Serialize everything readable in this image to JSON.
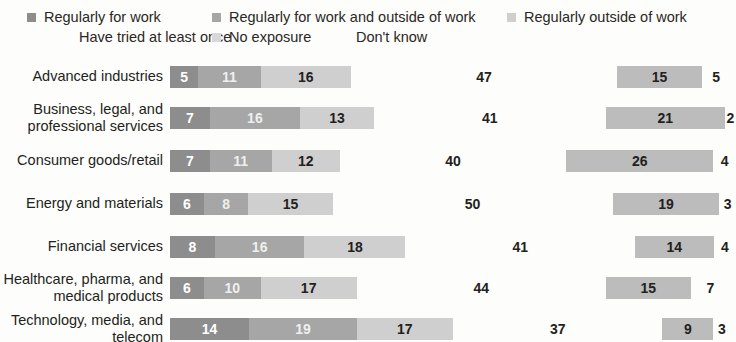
{
  "legend": {
    "items": [
      {
        "label": "Regularly for work",
        "color": "#8d8d8d",
        "has_swatch": true
      },
      {
        "label": "Have tried at least once",
        "color": "#bcbcbc",
        "has_swatch": false
      },
      {
        "label": "Regularly for work and outside of work",
        "color": "#a6a6a6",
        "has_swatch": true
      },
      {
        "label": "No exposure",
        "color": "#d8d8d8",
        "has_swatch": true
      },
      {
        "label": "Don't know",
        "color": "#fdfdfb",
        "has_swatch": false
      },
      {
        "label": "Regularly outside of work",
        "color": "#cfcfcf",
        "has_swatch": true
      }
    ]
  },
  "chart_data": {
    "type": "bar",
    "orientation": "horizontal",
    "stacked": true,
    "title": "",
    "subtitle": "",
    "xlabel": "",
    "ylabel": "",
    "xlim": [
      0,
      100
    ],
    "grid": false,
    "legend_position": "top",
    "units": "%",
    "categories": [
      "Advanced industries",
      "Business, legal, and professional services",
      "Consumer goods/retail",
      "Energy and materials",
      "Financial services",
      "Healthcare, pharma, and medical products",
      "Technology, media, and telecom"
    ],
    "category_label_lines": [
      [
        "Advanced industries"
      ],
      [
        "Business, legal, and",
        "professional services"
      ],
      [
        "Consumer goods/retail"
      ],
      [
        "Energy and materials"
      ],
      [
        "Financial services"
      ],
      [
        "Healthcare, pharma, and",
        "medical products"
      ],
      [
        "Technology, media, and",
        "telecom"
      ]
    ],
    "series": [
      {
        "name": "Regularly for work",
        "color": "#8d8d8d",
        "values": [
          5,
          7,
          7,
          6,
          8,
          6,
          14
        ]
      },
      {
        "name": "Regularly for work and outside of work",
        "color": "#a6a6a6",
        "values": [
          11,
          16,
          11,
          8,
          16,
          10,
          19
        ]
      },
      {
        "name": "Regularly outside of work",
        "color": "#cfcfcf",
        "values": [
          16,
          13,
          12,
          15,
          18,
          17,
          17
        ]
      },
      {
        "name": "No exposure",
        "color": "#fdfdfb",
        "values": [
          47,
          41,
          40,
          50,
          41,
          44,
          37
        ]
      },
      {
        "name": "Have tried at least once",
        "color": "#bcbcbc",
        "values": [
          15,
          21,
          26,
          19,
          14,
          15,
          9
        ]
      },
      {
        "name": "Don't know",
        "color": "#fdfdfb",
        "values": [
          5,
          2,
          4,
          3,
          4,
          7,
          3
        ]
      }
    ],
    "rows": [
      {
        "label": "Advanced industries",
        "values": [
          5,
          11,
          16,
          47,
          15,
          5
        ]
      },
      {
        "label": "Business, legal, and professional services",
        "values": [
          7,
          16,
          13,
          41,
          21,
          2
        ]
      },
      {
        "label": "Consumer goods/retail",
        "values": [
          7,
          11,
          12,
          40,
          26,
          4
        ]
      },
      {
        "label": "Energy and materials",
        "values": [
          6,
          8,
          15,
          50,
          19,
          3
        ]
      },
      {
        "label": "Financial services",
        "values": [
          8,
          16,
          18,
          41,
          14,
          4
        ]
      },
      {
        "label": "Healthcare, pharma, and medical products",
        "values": [
          6,
          10,
          17,
          44,
          15,
          7
        ]
      },
      {
        "label": "Technology, media, and telecom",
        "values": [
          14,
          19,
          17,
          37,
          9,
          3
        ]
      }
    ]
  }
}
